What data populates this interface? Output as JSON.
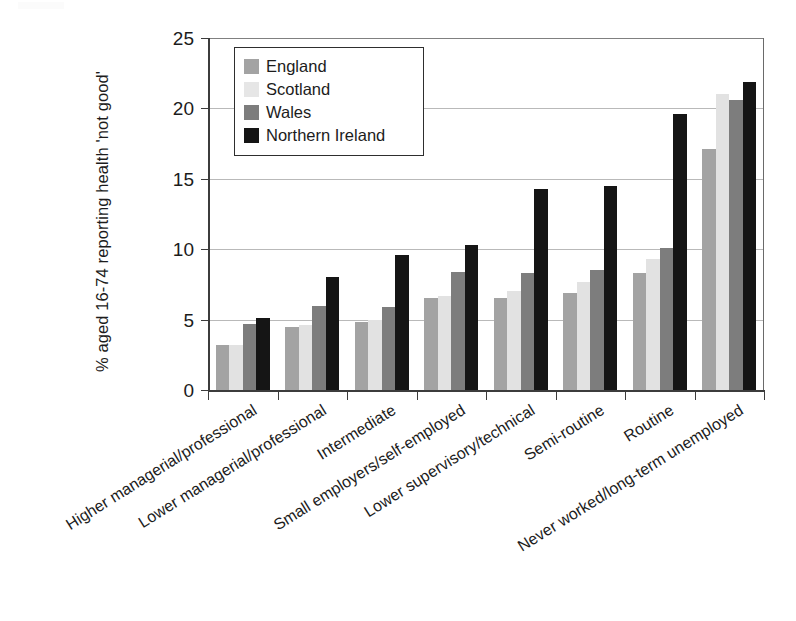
{
  "chart_data": {
    "type": "bar",
    "title": "",
    "xlabel": "",
    "ylabel": "% aged 16-74 reporting health 'not good'",
    "ylim": [
      0,
      25
    ],
    "yticks": [
      0,
      5,
      10,
      15,
      20,
      25
    ],
    "grid": true,
    "legend_position": "upper-left-inside",
    "categories": [
      "Higher managerial/professional",
      "Lower managerial/professional",
      "Intermediate",
      "Small employers/self-employed",
      "Lower supervisory/technical",
      "Semi-routine",
      "Routine",
      "Never worked/long-term unemployed"
    ],
    "series": [
      {
        "name": "England",
        "color": "#a3a3a3",
        "values": [
          3.2,
          4.5,
          4.8,
          6.5,
          6.5,
          6.9,
          8.3,
          17.1
        ]
      },
      {
        "name": "Scotland",
        "color": "#e2e2e2",
        "values": [
          3.2,
          4.6,
          5.0,
          6.7,
          7.0,
          7.7,
          9.3,
          21.0
        ]
      },
      {
        "name": "Wales",
        "color": "#7d7d7d",
        "values": [
          4.7,
          6.0,
          5.9,
          8.4,
          8.3,
          8.5,
          10.1,
          20.6
        ]
      },
      {
        "name": "Northern Ireland",
        "color": "#151515",
        "values": [
          5.1,
          8.0,
          9.6,
          10.3,
          14.3,
          14.5,
          19.6,
          21.9
        ]
      }
    ]
  },
  "legend": {
    "items": [
      {
        "label": "England"
      },
      {
        "label": "Scotland"
      },
      {
        "label": "Wales"
      },
      {
        "label": "Northern Ireland"
      }
    ]
  }
}
